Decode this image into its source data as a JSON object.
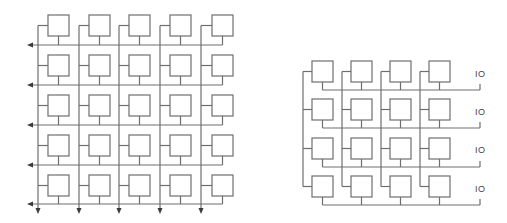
{
  "colors": {
    "line": "#6e6e6e",
    "arrow": "#3a3a3a",
    "label": "#444444",
    "background": "#ffffff"
  },
  "left_grid": {
    "rows": 5,
    "cols": 5,
    "box_size": 21,
    "box_x": [
      48,
      89,
      129,
      170,
      212
    ],
    "box_y": [
      15,
      55,
      95,
      135,
      175
    ],
    "vline_x": [
      38,
      79,
      119,
      160,
      201
    ],
    "hline_y": [
      45,
      85,
      125,
      165,
      204
    ],
    "hline_arrow": "left",
    "vline_arrow": "down",
    "arrow_left_x": 27,
    "arrow_down_y": 214
  },
  "right_grid": {
    "rows": 4,
    "cols": 4,
    "box_size": 21,
    "box_x": [
      312,
      351,
      390,
      429
    ],
    "box_y": [
      61,
      99,
      138,
      176
    ],
    "vline_x": [
      303,
      342,
      381,
      420
    ],
    "hline_y": [
      90,
      128,
      167,
      205
    ],
    "hline_end_x": 480,
    "io_labels": [
      "IO",
      "IO",
      "IO",
      "IO"
    ],
    "io_label_y": [
      69,
      107,
      145,
      184
    ],
    "io_label_x": 475
  }
}
